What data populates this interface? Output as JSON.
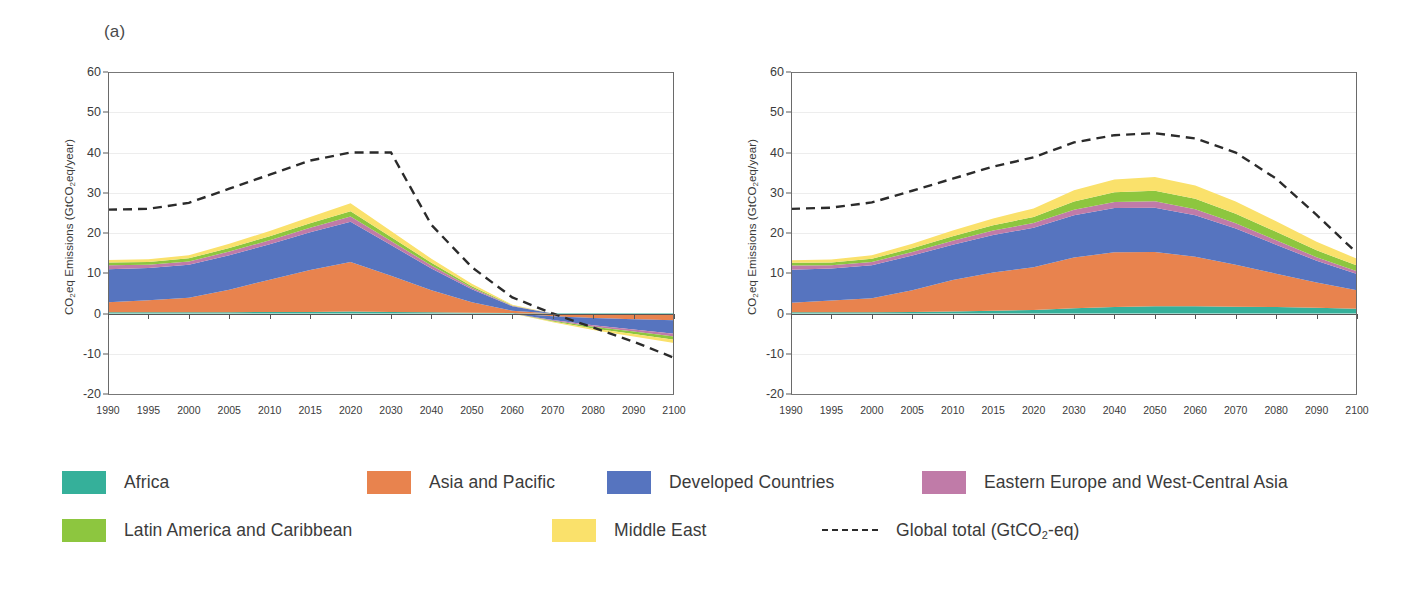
{
  "panel": {
    "label": "(a)"
  },
  "axes": {
    "ylabel_pre": "CO",
    "ylabel_sub": "2",
    "ylabel_post": "eq Emissions (GtCO",
    "ylabel_sub2": "2",
    "ylabel_end": "eq/year)",
    "ylabel_full": "CO2eq Emissions (GtCO2eq/year)",
    "yticks": [
      "60",
      "50",
      "40",
      "30",
      "20",
      "10",
      "0",
      "-10",
      "-20"
    ],
    "ylim": [
      -20,
      60
    ],
    "xticks": [
      "1990",
      "1995",
      "2000",
      "2005",
      "2010",
      "2015",
      "2020",
      "2030",
      "2040",
      "2050",
      "2060",
      "2070",
      "2080",
      "2090",
      "2100"
    ],
    "xlim": [
      1990,
      2100
    ]
  },
  "colors": {
    "africa": "#35b09a",
    "asia_pacific": "#e8834e",
    "developed": "#5674bf",
    "eastern_europe": "#c07ba8",
    "latin_america": "#8dc63f",
    "middle_east": "#fae16b",
    "global_total": "#2b2b2b",
    "gridline": "#ededed",
    "axis": "#6a6a6a"
  },
  "legend": {
    "rows": [
      [
        {
          "key": "africa",
          "label": "Africa",
          "color": "#35b09a",
          "type": "swatch"
        },
        {
          "key": "asia_pacific",
          "label": "Asia and Pacific",
          "color": "#e8834e",
          "type": "swatch"
        },
        {
          "key": "developed",
          "label": "Developed Countries",
          "color": "#5674bf",
          "type": "swatch"
        },
        {
          "key": "eastern_europe",
          "label": "Eastern Europe and West-Central Asia",
          "color": "#c07ba8",
          "type": "swatch"
        }
      ],
      [
        {
          "key": "latin_america",
          "label": "Latin America and Caribbean",
          "color": "#8dc63f",
          "type": "swatch"
        },
        {
          "key": "middle_east",
          "label": "Middle East",
          "color": "#fae16b",
          "type": "swatch"
        },
        {
          "key": "global_total",
          "label": "Global total (GtCO2-eq)",
          "color": "#2b2b2b",
          "type": "dashed"
        }
      ]
    ]
  },
  "chart_data": [
    {
      "id": "chart-a",
      "type": "area",
      "stacked": true,
      "title": "",
      "xlabel": "",
      "ylabel": "CO2eq Emissions (GtCO2eq/year)",
      "ylim": [
        -20,
        60
      ],
      "xlim": [
        1990,
        2100
      ],
      "grid": true,
      "legend_position": "bottom",
      "x": [
        1990,
        1995,
        2000,
        2005,
        2010,
        2015,
        2020,
        2030,
        2040,
        2050,
        2060,
        2070,
        2080,
        2090,
        2100
      ],
      "series": [
        {
          "name": "Africa",
          "color": "#35b09a",
          "values": [
            0.3,
            0.3,
            0.3,
            0.3,
            0.4,
            0.4,
            0.5,
            0.4,
            0.3,
            0.2,
            0.1,
            -0.1,
            -0.2,
            -0.3,
            -0.4
          ]
        },
        {
          "name": "Asia and Pacific",
          "color": "#e8834e",
          "values": [
            2.5,
            3.0,
            3.6,
            5.6,
            8.0,
            10.4,
            12.3,
            9.0,
            5.5,
            2.6,
            0.6,
            -0.6,
            -0.9,
            -1.1,
            -1.3
          ]
        },
        {
          "name": "Developed Countries",
          "color": "#5674bf",
          "values": [
            8.2,
            8.0,
            8.2,
            8.6,
            8.8,
            9.4,
            10.0,
            7.6,
            5.4,
            3.2,
            1.1,
            -0.9,
            -1.8,
            -2.6,
            -3.3
          ]
        },
        {
          "name": "Eastern Europe and West-Central Asia",
          "color": "#c07ba8",
          "values": [
            1.0,
            0.8,
            0.8,
            0.9,
            1.0,
            1.1,
            1.3,
            1.0,
            0.7,
            0.4,
            0.1,
            -0.2,
            -0.4,
            -0.5,
            -0.7
          ]
        },
        {
          "name": "Latin America and Caribbean",
          "color": "#8dc63f",
          "values": [
            0.7,
            0.7,
            0.8,
            0.9,
            1.0,
            1.1,
            1.3,
            1.0,
            0.7,
            0.4,
            0.1,
            -0.2,
            -0.4,
            -0.6,
            -0.8
          ]
        },
        {
          "name": "Middle East",
          "color": "#fae16b",
          "values": [
            0.6,
            0.7,
            0.8,
            1.0,
            1.3,
            1.6,
            2.0,
            1.5,
            1.0,
            0.6,
            0.2,
            -0.2,
            -0.4,
            -0.6,
            -0.8
          ]
        }
      ],
      "line_series": {
        "name": "Global total (GtCO2-eq)",
        "color": "#2b2b2b",
        "dashed": true,
        "values": [
          25.8,
          26.0,
          27.5,
          31.0,
          34.5,
          38.0,
          40.0,
          40.0,
          22.0,
          11.5,
          4.0,
          0.0,
          -3.5,
          -7.0,
          -11.0
        ]
      }
    },
    {
      "id": "chart-b",
      "type": "area",
      "stacked": true,
      "title": "",
      "xlabel": "",
      "ylabel": "CO2eq Emissions (GtCO2eq/year)",
      "ylim": [
        -20,
        60
      ],
      "xlim": [
        1990,
        2100
      ],
      "grid": true,
      "legend_position": "bottom",
      "x": [
        1990,
        1995,
        2000,
        2005,
        2010,
        2015,
        2020,
        2030,
        2040,
        2050,
        2060,
        2070,
        2080,
        2090,
        2100
      ],
      "series": [
        {
          "name": "Africa",
          "color": "#35b09a",
          "values": [
            0.3,
            0.3,
            0.3,
            0.4,
            0.5,
            0.7,
            0.9,
            1.3,
            1.6,
            1.8,
            1.8,
            1.7,
            1.6,
            1.4,
            1.2
          ]
        },
        {
          "name": "Asia and Pacific",
          "color": "#e8834e",
          "values": [
            2.4,
            2.9,
            3.5,
            5.4,
            7.8,
            9.5,
            10.6,
            12.6,
            13.6,
            13.5,
            12.3,
            10.4,
            8.3,
            6.3,
            4.6
          ]
        },
        {
          "name": "Developed Countries",
          "color": "#5674bf",
          "values": [
            8.2,
            8.0,
            8.2,
            8.6,
            8.8,
            9.3,
            9.8,
            10.5,
            11.0,
            11.0,
            10.3,
            9.0,
            7.2,
            5.4,
            4.0
          ]
        },
        {
          "name": "Eastern Europe and West-Central Asia",
          "color": "#c07ba8",
          "values": [
            1.0,
            0.8,
            0.8,
            0.9,
            1.0,
            1.1,
            1.2,
            1.4,
            1.5,
            1.6,
            1.5,
            1.3,
            1.1,
            0.9,
            0.7
          ]
        },
        {
          "name": "Latin America and Caribbean",
          "color": "#8dc63f",
          "values": [
            0.7,
            0.7,
            0.8,
            0.9,
            1.1,
            1.3,
            1.5,
            2.0,
            2.4,
            2.6,
            2.6,
            2.4,
            2.1,
            1.7,
            1.4
          ]
        },
        {
          "name": "Middle East",
          "color": "#fae16b",
          "values": [
            0.6,
            0.7,
            0.9,
            1.1,
            1.4,
            1.7,
            2.1,
            2.8,
            3.2,
            3.4,
            3.3,
            3.0,
            2.6,
            2.1,
            1.7
          ]
        }
      ],
      "line_series": {
        "name": "Global total (GtCO2-eq)",
        "color": "#2b2b2b",
        "dashed": true,
        "values": [
          26.0,
          26.3,
          27.6,
          30.5,
          33.5,
          36.5,
          38.8,
          42.5,
          44.3,
          44.8,
          43.5,
          40.0,
          33.5,
          24.5,
          15.0
        ]
      }
    }
  ]
}
